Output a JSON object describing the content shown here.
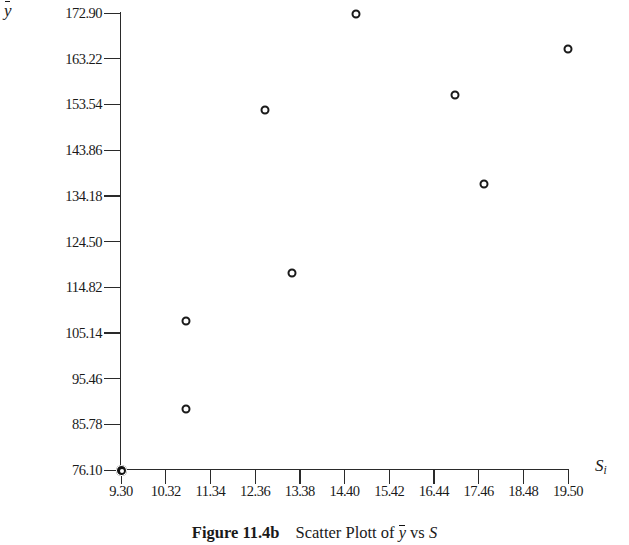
{
  "figure": {
    "caption_label": "Figure 11.4b",
    "caption_text_pre": "Scatter Plott of ",
    "caption_ybar": "y",
    "caption_text_mid": " vs ",
    "caption_s": "S",
    "caption_full": "Figure 11.4b   Scatter Plott of ȳ vs S"
  },
  "axes": {
    "y_title": "y",
    "y_title_note": "y-bar (mean of y)",
    "x_title": "S",
    "x_title_sub": "i"
  },
  "chart_data": {
    "type": "scatter",
    "xlabel": "S_i",
    "ylabel": "ȳ",
    "xlim": [
      9.3,
      19.5
    ],
    "ylim": [
      76.1,
      172.9
    ],
    "grid": false,
    "legend": null,
    "marker": "open-circle",
    "xticks": [
      "9.30",
      "10.32",
      "11.34",
      "12.36",
      "13.38",
      "14.40",
      "15.42",
      "16.44",
      "17.46",
      "18.48",
      "19.50"
    ],
    "xtick_values": [
      9.3,
      10.32,
      11.34,
      12.36,
      13.38,
      14.4,
      15.42,
      16.44,
      17.46,
      18.48,
      19.5
    ],
    "yticks": [
      "76.10",
      "85.78",
      "95.46",
      "105.14",
      "114.82",
      "124.50",
      "134.18",
      "143.86",
      "153.54",
      "163.22",
      "172.90"
    ],
    "ytick_values": [
      76.1,
      85.78,
      95.46,
      105.14,
      114.82,
      124.5,
      134.18,
      143.86,
      153.54,
      163.22,
      172.9
    ],
    "points": [
      {
        "x": 10.78,
        "y": 107.7
      },
      {
        "x": 10.78,
        "y": 89.05
      },
      {
        "x": 12.58,
        "y": 152.4
      },
      {
        "x": 13.2,
        "y": 117.9
      },
      {
        "x": 14.66,
        "y": 172.6
      },
      {
        "x": 16.92,
        "y": 155.6
      },
      {
        "x": 17.58,
        "y": 136.7
      },
      {
        "x": 19.5,
        "y": 165.2
      }
    ]
  },
  "colors": {
    "ink": "#1a1a1a",
    "axis": "#2a2a2a",
    "background": "#ffffff"
  }
}
